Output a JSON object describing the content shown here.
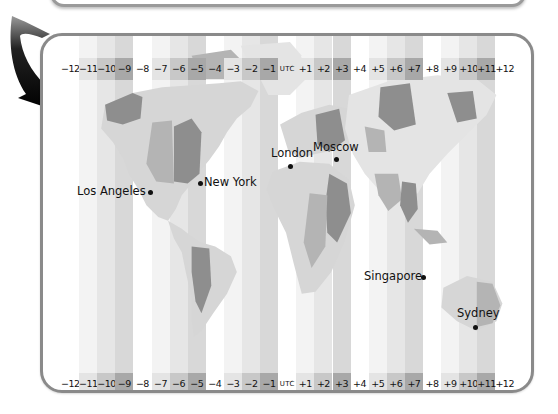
{
  "time_zones": {
    "labels": [
      "−12",
      "−11",
      "−10",
      "−9",
      "−8",
      "−7",
      "−6",
      "−5",
      "−4",
      "−3",
      "−2",
      "−1",
      "UTC",
      "+1",
      "+2",
      "+3",
      "+4",
      "+5",
      "+6",
      "+7",
      "+8",
      "+9",
      "+10",
      "+11",
      "+12"
    ],
    "shades": [
      0,
      1,
      2,
      3,
      0,
      1,
      2,
      3,
      0,
      1,
      2,
      3,
      0,
      1,
      2,
      3,
      0,
      1,
      2,
      3,
      0,
      1,
      2,
      3,
      0
    ],
    "shade_colors": [
      "#ffffff",
      "#e4e4e4",
      "#c8c8c8",
      "#a8a8a8"
    ]
  },
  "cities": [
    {
      "name": "Los Angeles",
      "label_side": "left"
    },
    {
      "name": "New York",
      "label_side": "right"
    },
    {
      "name": "London",
      "label_side": "above"
    },
    {
      "name": "Moscow",
      "label_side": "above"
    },
    {
      "name": "Singapore",
      "label_side": "left"
    },
    {
      "name": "Sydney",
      "label_side": "above"
    }
  ],
  "colors": {
    "panel_border": "#8a8a8a",
    "land_light": "#d6d6d6",
    "land_mid": "#b4b4b4",
    "land_dark": "#8e8e8e",
    "arrow": "#111111"
  }
}
